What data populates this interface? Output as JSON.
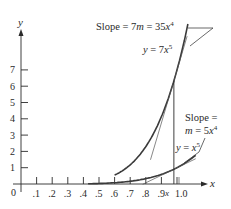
{
  "chart_data": {
    "type": "line",
    "title": "",
    "xlabel": "x",
    "ylabel": "y",
    "xlim": [
      0,
      1.15
    ],
    "ylim": [
      0,
      8
    ],
    "grid": false,
    "legend": null,
    "x_ticks": [
      ".1",
      ".2",
      ".3",
      ".4",
      ".5",
      ".6",
      ".7",
      ".8",
      ".9",
      "1.0"
    ],
    "x_tick_values": [
      0.1,
      0.2,
      0.3,
      0.4,
      0.5,
      0.6,
      0.7,
      0.8,
      0.9,
      1.0
    ],
    "y_ticks": [
      "1",
      "2",
      "3",
      "4",
      "5",
      "6",
      "7"
    ],
    "y_tick_values": [
      1,
      2,
      3,
      4,
      5,
      6,
      7
    ],
    "origin_label": "0",
    "x_marker_label": "x",
    "x_marker_value": 0.98,
    "series": [
      {
        "name": "y = 7x^5",
        "function": "7x^5",
        "x_range": [
          0.6,
          1.07
        ],
        "x": [
          0.6,
          0.7,
          0.8,
          0.9,
          0.98,
          1.07
        ],
        "y": [
          0.54,
          1.18,
          2.29,
          4.13,
          6.33,
          9.8
        ]
      },
      {
        "name": "y = x^5",
        "function": "x^5",
        "x_range": [
          0.43,
          1.12
        ],
        "x": [
          0.43,
          0.5,
          0.6,
          0.7,
          0.8,
          0.9,
          0.98,
          1.12
        ],
        "y": [
          0.015,
          0.031,
          0.078,
          0.168,
          0.328,
          0.59,
          0.904,
          1.76
        ]
      }
    ],
    "annotations": [
      {
        "text": "Slope = 7m = 35x⁴",
        "target": "tangent to y = 7x^5"
      },
      {
        "text": "y = 7x⁵",
        "target": "upper curve"
      },
      {
        "text": "Slope = m = 5x⁴",
        "target": "tangent to y = x^5"
      },
      {
        "text": "y = x⁵",
        "target": "lower curve"
      }
    ]
  },
  "labels": {
    "y_axis": "y",
    "x_axis": "x",
    "origin": "0",
    "x_marker": "x",
    "slope_big_prefix": "Slope = 7",
    "slope_big_m": "m",
    "slope_big_eq": " = 35",
    "slope_big_x": "x",
    "slope_big_exp": "4",
    "curve_big_y": "y",
    "curve_big_eq": " = 7",
    "curve_big_x": "x",
    "curve_big_exp": "5",
    "slope_small_line1": "Slope =",
    "slope_small_m": "m",
    "slope_small_eq": " = 5",
    "slope_small_x": "x",
    "slope_small_exp": "4",
    "curve_small_y": "y",
    "curve_small_eq": " = ",
    "curve_small_x": "x",
    "curve_small_exp": "5"
  },
  "colors": {
    "axis": "#2a2a2a",
    "curve": "#3a3a3a",
    "tangent": "#555555"
  }
}
